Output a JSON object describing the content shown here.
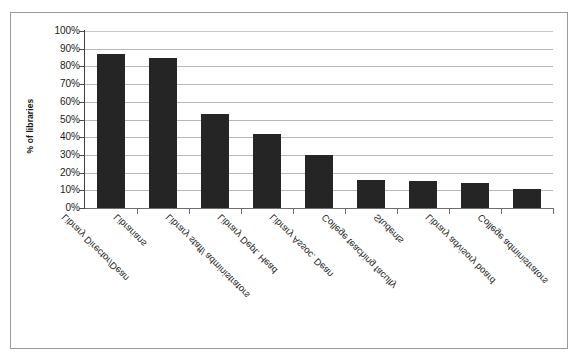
{
  "chart_data": {
    "type": "bar",
    "title": "",
    "xlabel": "",
    "ylabel": "% of libraries",
    "ylim": [
      0,
      100
    ],
    "grid": true,
    "legend": false,
    "y_tick_labels": [
      "100%",
      "90%",
      "80%",
      "70%",
      "60%",
      "50%",
      "40%",
      "30%",
      "20%",
      "10%",
      "0%"
    ],
    "y_tick_values": [
      100,
      90,
      80,
      70,
      60,
      50,
      40,
      30,
      20,
      10,
      0
    ],
    "categories": [
      "Library Director/Dean",
      "Librarians",
      "Library staff/ administrators",
      "Library Dept. Head",
      "Library Assoc. Dean",
      "College teaching faculty",
      "Students",
      "Library advisory board",
      "College administrators"
    ],
    "values": [
      87,
      85,
      53,
      42,
      30,
      16,
      15,
      14,
      11
    ],
    "bar_color": "#252525",
    "gridline_color": "#b9b9b9",
    "axis_color": "#3f3f3f",
    "background_color": "#ffffff"
  }
}
